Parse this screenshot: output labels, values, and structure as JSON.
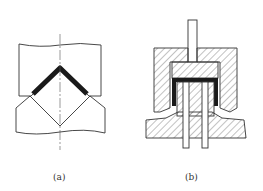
{
  "figures": [
    {
      "id": "a",
      "caption": "(a)",
      "description": "V-bend die with bent sheet (dark) between V-shaped punch and die"
    },
    {
      "id": "b",
      "caption": "(b)",
      "description": "Cross-section of cup-forming tool with hatched die, punch plate, rod, and dark formed cup"
    }
  ],
  "colors": {
    "line": "#333333",
    "part": "#1a1a1a",
    "hatch": "#555555"
  }
}
